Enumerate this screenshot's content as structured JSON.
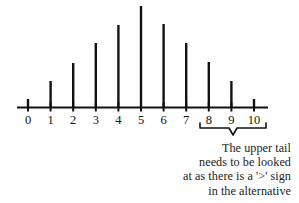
{
  "figure": {
    "title": "",
    "background_color": "#ffffff",
    "line_color": "#000000",
    "text_color": "#1a1a1a"
  },
  "axis": {
    "x_start_px": 17,
    "x_end_px": 268,
    "baseline_y_px": 107.5,
    "tick_labels": [
      "0",
      "1",
      "2",
      "3",
      "4",
      "5",
      "6",
      "7",
      "8",
      "9",
      "10"
    ]
  },
  "bracket": {
    "name": "upper-tail-bracket",
    "covers_labels": [
      "8",
      "9",
      "10"
    ],
    "left_x_px": 200,
    "right_x_px": 266,
    "top_y_px": 128,
    "tip_y_px": 135
  },
  "annotation": {
    "lines": [
      "The upper tail",
      "needs to be looked",
      "at as there is a '>' sign",
      "in the alternative"
    ]
  },
  "chart_data": {
    "type": "bar",
    "title": "",
    "xlabel": "",
    "ylabel": "",
    "categories": [
      "0",
      "1",
      "2",
      "3",
      "4",
      "5",
      "6",
      "7",
      "8",
      "9",
      "10"
    ],
    "x": [
      0,
      1,
      2,
      3,
      4,
      5,
      6,
      7,
      8,
      9,
      10
    ],
    "values": [
      0.08,
      0.26,
      0.44,
      0.64,
      0.82,
      1.0,
      0.83,
      0.64,
      0.45,
      0.26,
      0.08
    ],
    "values_pixel_top_y": [
      99,
      81,
      63,
      43,
      25,
      6,
      24,
      43,
      62,
      81,
      99
    ],
    "ylim": [
      0,
      1
    ],
    "grid": false,
    "legend": null,
    "annotations": [
      {
        "text": "The upper tail needs to be looked at as there is a '>' sign in the alternative",
        "target_categories": [
          "8",
          "9",
          "10"
        ]
      }
    ]
  }
}
